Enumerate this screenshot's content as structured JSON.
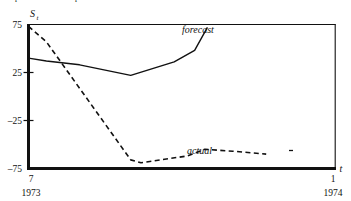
{
  "caption": {
    "text": "Expected value of expectations"
  },
  "chart_data": {
    "type": "line",
    "title": "",
    "xlabel": "t",
    "ylabel": "S_t",
    "ylabel_base": "S",
    "ylabel_sub": "t",
    "ylim": [
      -75,
      75
    ],
    "yticks": [
      75,
      25,
      -25,
      -75
    ],
    "ytick_labels": [
      "75",
      "25",
      "–25",
      "–75"
    ],
    "xlim": [
      0,
      6
    ],
    "xticks": [
      0,
      6
    ],
    "xtick_labels": [
      "7",
      "1"
    ],
    "xtick_sublabels": [
      "1973",
      "1974"
    ],
    "grid": false,
    "legend": "inline-annotations",
    "series": [
      {
        "name": "forecast",
        "style": "solid",
        "color": "#111111",
        "label_x": 3.55,
        "label_y": 70,
        "x": [
          0,
          0.35,
          1.0,
          2.0,
          2.85,
          3.25,
          3.5
        ],
        "values": [
          40,
          37,
          33,
          22,
          36,
          48,
          72
        ]
      },
      {
        "name": "actual",
        "style": "dashed",
        "color": "#111111",
        "label_x": 3.6,
        "label_y": -58,
        "x": [
          0,
          0.35,
          2.0,
          2.2,
          3.1,
          3.45,
          4.0,
          4.65
        ],
        "values": [
          73,
          57,
          -66,
          -69,
          -62,
          -55,
          -57,
          -60
        ]
      }
    ]
  },
  "plot_frame": {
    "stroke_color": "#111111"
  }
}
